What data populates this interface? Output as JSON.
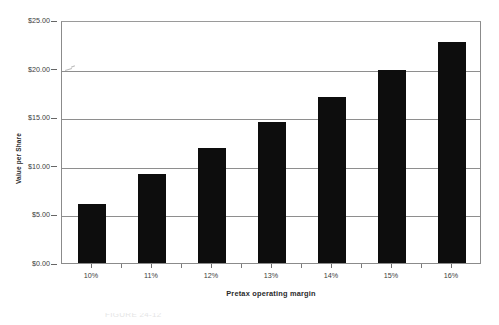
{
  "chart_data": {
    "type": "bar",
    "title": "",
    "subtitle": "",
    "xlabel": "Pretax operating margin",
    "ylabel": "Value per Share",
    "categories": [
      "10%",
      "11%",
      "12%",
      "13%",
      "14%",
      "15%",
      "16%"
    ],
    "values": [
      6.1,
      9.2,
      11.8,
      14.5,
      17.1,
      19.9,
      22.7
    ],
    "value_labels": [
      "$6.10",
      "$9.20",
      "$11.80",
      "$14.50",
      "$17.10",
      "$19.90",
      "$22.70"
    ],
    "series": [
      {
        "name": "Value per Share",
        "values": [
          6.1,
          9.2,
          11.8,
          14.5,
          17.1,
          19.9,
          22.7
        ],
        "color": "#0d0d0d"
      }
    ],
    "ylim": [
      0,
      25
    ],
    "xlim_categories": 7,
    "y_ticks": [
      0,
      5,
      10,
      15,
      20,
      25
    ],
    "y_tick_labels": [
      "$0.00",
      "$5.00",
      "$10.00",
      "$15.00",
      "$20.00",
      "$25.00"
    ],
    "grid": true,
    "grid_axis": "y",
    "grid_color": "#8e8e8e",
    "legend": false,
    "legend_position": "none",
    "plot_border": true,
    "plot_border_color": "#8b8b8b",
    "background_color": "#ffffff",
    "bar_color": "#0d0d0d",
    "bar_width_ratio": 0.48,
    "axis_label_color": "#3c3c3c",
    "axis_title_color": "#2b2b2b"
  },
  "caption": {
    "text": "FIGURE 24-12"
  }
}
